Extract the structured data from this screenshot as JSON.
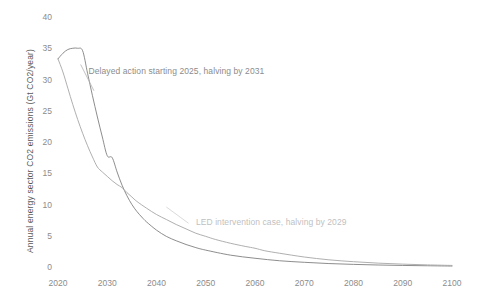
{
  "chart_data": {
    "type": "line",
    "title": "",
    "xlabel": "",
    "ylabel": "Annual energy sector CO2 emissions (Gt CO2/year)",
    "xlim": [
      2020,
      2100
    ],
    "ylim": [
      0,
      40
    ],
    "xticks": [
      "2020",
      "2030",
      "2040",
      "2050",
      "2060",
      "2070",
      "2080",
      "2090",
      "2100"
    ],
    "yticks": [
      "0",
      "5",
      "10",
      "15",
      "20",
      "25",
      "30",
      "35",
      "40"
    ],
    "grid": false,
    "legend_position": "inline-annotation",
    "annotations": [
      {
        "id": "delayed",
        "text": "Delayed action starting 2025, halving by 2031",
        "color": "#8c8c8c"
      },
      {
        "id": "led",
        "text": "LED intervention case, halving by 2029",
        "color": "#bfbfbf"
      }
    ],
    "series": [
      {
        "name": "Delayed action starting 2025, halving by 2031",
        "color": "#808080",
        "x": [
          2020,
          2021,
          2022,
          2023,
          2024,
          2025,
          2026,
          2027,
          2028,
          2029,
          2030,
          2031,
          2032,
          2033,
          2034,
          2035,
          2036,
          2037,
          2038,
          2040,
          2042,
          2044,
          2046,
          2048,
          2050,
          2055,
          2060,
          2065,
          2070,
          2075,
          2080,
          2085,
          2090,
          2095,
          2100
        ],
        "y": [
          33.3,
          34.2,
          34.8,
          35.0,
          35.0,
          34.6,
          31.0,
          27.4,
          24.0,
          20.8,
          17.8,
          17.5,
          15.2,
          13.1,
          11.4,
          10.0,
          8.9,
          8.0,
          7.2,
          5.9,
          4.9,
          4.2,
          3.6,
          3.1,
          2.7,
          1.9,
          1.4,
          1.0,
          0.75,
          0.55,
          0.42,
          0.32,
          0.25,
          0.2,
          0.15
        ]
      },
      {
        "name": "LED intervention case, halving by 2029",
        "color": "#a6a6a6",
        "x": [
          2020,
          2021,
          2022,
          2023,
          2024,
          2025,
          2026,
          2027,
          2028,
          2029,
          2030,
          2031,
          2032,
          2033,
          2034,
          2035,
          2036,
          2038,
          2040,
          2042,
          2044,
          2046,
          2048,
          2050,
          2052,
          2055,
          2058,
          2060,
          2062,
          2065,
          2070,
          2075,
          2080,
          2085,
          2090,
          2095,
          2100
        ],
        "y": [
          33.3,
          31.2,
          28.6,
          26.0,
          23.6,
          21.4,
          19.4,
          17.6,
          16.0,
          15.2,
          14.5,
          13.8,
          13.2,
          12.7,
          11.9,
          11.2,
          10.5,
          9.4,
          8.4,
          7.6,
          6.8,
          6.1,
          5.4,
          4.9,
          4.4,
          3.8,
          3.3,
          3.0,
          2.6,
          2.2,
          1.6,
          1.15,
          0.85,
          0.62,
          0.46,
          0.34,
          0.25
        ]
      }
    ]
  }
}
